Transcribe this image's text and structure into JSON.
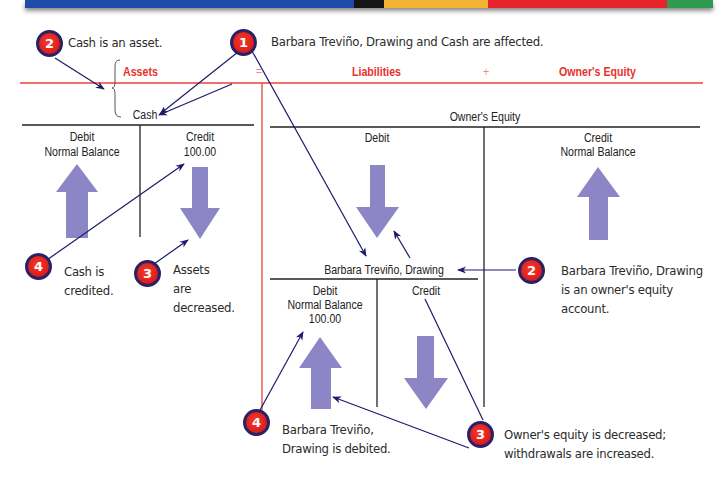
{
  "banner": {
    "segments": [
      {
        "color": "#1f4aa8",
        "width": 425
      },
      {
        "color": "#151515",
        "width": 38
      },
      {
        "color": "#f3b233",
        "width": 135
      },
      {
        "color": "#e8242a",
        "width": 230
      },
      {
        "color": "#2e9a4e",
        "width": 60
      }
    ]
  },
  "equation": {
    "assets": "Assets",
    "equals": "=",
    "liabilities": "Liabilities",
    "plus": "+",
    "owners_equity": "Owner's Equity",
    "color": "#e8322b"
  },
  "cash_account": {
    "title": "Cash",
    "debit_header": "Debit",
    "debit_sub": "Normal Balance",
    "credit_header": "Credit",
    "credit_amount": "100.00"
  },
  "owners_equity_account": {
    "title": "Owner's Equity",
    "debit_header": "Debit",
    "credit_header": "Credit",
    "credit_sub": "Normal Balance"
  },
  "drawing_account": {
    "title": "Barbara Treviño, Drawing",
    "debit_header": "Debit",
    "debit_sub": "Normal Balance",
    "debit_amount": "100.00",
    "credit_header": "Credit"
  },
  "callouts": [
    {
      "number": "1",
      "text": "Barbara Treviño, Drawing and Cash are affected."
    },
    {
      "number": "2",
      "text": "Cash is an asset."
    },
    {
      "number": "3",
      "line1": "Assets",
      "line2": "are",
      "line3": "decreased."
    },
    {
      "number": "4",
      "line1": "Cash is",
      "line2": "credited."
    },
    {
      "number": "2",
      "line1": "Barbara Treviño, Drawing",
      "line2": "is an owner's equity",
      "line3": "account."
    },
    {
      "number": "4",
      "line1": "Barbara Treviño,",
      "line2": "Drawing is debited."
    },
    {
      "number": "3",
      "line1": "Owner's equity is decreased;",
      "line2": "withdrawals are increased."
    }
  ],
  "colors": {
    "arrow_fill": "#8d86c6",
    "pointer_line": "#1c1a6b",
    "badge_red": "#e0201c",
    "badge_border": "#2a2266"
  }
}
